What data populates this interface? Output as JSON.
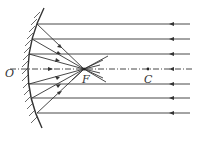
{
  "diagram": {
    "labels": {
      "vertex": "O",
      "focus": "F",
      "center": "C"
    },
    "colors": {
      "line": "#333333",
      "background": "#ffffff"
    },
    "geometry": {
      "axis_y": 69,
      "focus_x": 84,
      "center_x": 148,
      "ray_ys": [
        24,
        39,
        54,
        84,
        98,
        113
      ],
      "ray_right_x": 190,
      "arrow_x": 172
    }
  }
}
